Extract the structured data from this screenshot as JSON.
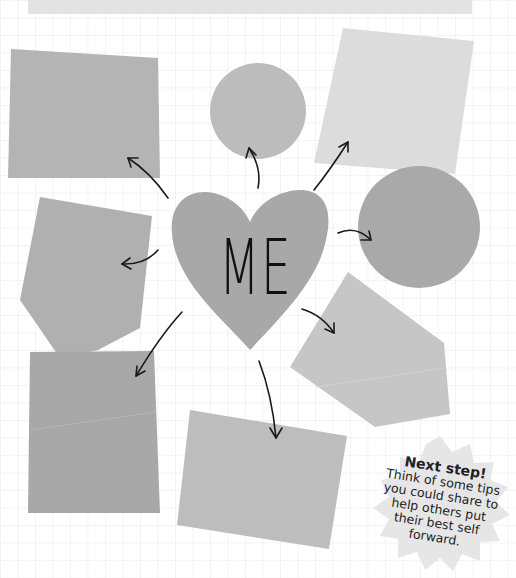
{
  "center": {
    "label": "ME",
    "shape": "heart"
  },
  "callout": {
    "title": "Next step!",
    "body": "Think of some tips you could share to help others put their best self forward."
  },
  "shapes": [
    {
      "name": "top-left-rectangle",
      "color": "#b4b4b4"
    },
    {
      "name": "top-center-circle",
      "color": "#bcbcbc"
    },
    {
      "name": "top-right-square",
      "color": "#dcdcdc"
    },
    {
      "name": "right-circle",
      "color": "#a9a9a9"
    },
    {
      "name": "right-pentagon",
      "color": "#c6c6c6"
    },
    {
      "name": "bottom-center-rectangle",
      "color": "#bdbdbd"
    },
    {
      "name": "bottom-left-rectangle",
      "color": "#a8a8a8"
    },
    {
      "name": "left-pentagon",
      "color": "#b0b0b0"
    }
  ],
  "colors": {
    "heart": "#a8a8a8",
    "burst": "#e6e6e6",
    "arrows": "#1a1a1a",
    "background": "#ffffff"
  }
}
